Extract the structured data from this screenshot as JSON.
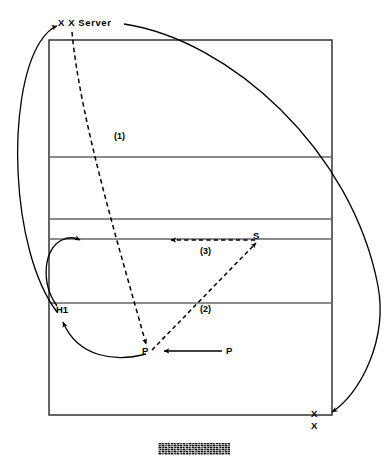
{
  "figure": {
    "kind": "volleyball-court-play-diagram",
    "width": 388,
    "height": 462,
    "background_color": "#ffffff",
    "ink_color": "#000000",
    "court_line_color": "#555555"
  },
  "court": {
    "name": "volleyball-court",
    "left": 49,
    "top": 40,
    "right": 332,
    "bottom": 415,
    "horizontal_lines_y": [
      157,
      219,
      239,
      303
    ],
    "border_width": 1.4
  },
  "labels": {
    "server": "X X Server",
    "phase_1": "(1)",
    "phase_2": "(2)",
    "phase_3": "(3)",
    "setter": "S",
    "hitter": "H1",
    "passer_target": "P",
    "passer_source": "P",
    "x_marker_top": "X",
    "x_marker_bottom": "X"
  },
  "paths": {
    "serve_1": {
      "style": "dashed",
      "from": [
        72,
        32
      ],
      "to": [
        148,
        352
      ],
      "description": "serve travels from server across court to passer"
    },
    "pass_2": {
      "style": "dashed",
      "from": [
        150,
        352
      ],
      "to": [
        259,
        240
      ],
      "description": "pass from P up to S"
    },
    "set_3": {
      "style": "dashed",
      "from": [
        257,
        240
      ],
      "to": [
        167,
        240
      ],
      "description": "set from S across the front row"
    },
    "player_move_p": {
      "style": "solid",
      "from": [
        222,
        352
      ],
      "to": [
        160,
        352
      ],
      "description": "passer moves left into position"
    },
    "player_move_h1": {
      "style": "solid-curve",
      "from": [
        148,
        358
      ],
      "to": [
        62,
        312
      ],
      "description": "passer transitions out to hitter H1 position"
    },
    "loop_left": {
      "style": "solid-curve",
      "from": [
        60,
        312
      ],
      "to": [
        82,
        242
      ],
      "description": "small loop returning to the left front"
    },
    "long_left_curve": {
      "style": "solid-curve",
      "from": [
        56,
        310
      ],
      "to": [
        56,
        26
      ],
      "description": "long curve sweeping left back to the serving position"
    },
    "long_right_curve": {
      "style": "solid-curve",
      "from": [
        128,
        24
      ],
      "to": [
        330,
        414
      ],
      "description": "long curve sweeping right down to the bottom-right X markers"
    }
  },
  "caption": {
    "redacted": true,
    "note": ""
  }
}
